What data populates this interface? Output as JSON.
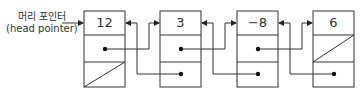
{
  "diagram": {
    "type": "doubly-linked-list",
    "head_label_ko": "머리 포인터",
    "head_label_en": "(head pointer)",
    "nodes": [
      {
        "value": "12",
        "prev": "null",
        "next": "node2"
      },
      {
        "value": "3",
        "prev": "node1",
        "next": "node3"
      },
      {
        "value": "−8",
        "prev": "node2",
        "next": "node4"
      },
      {
        "value": "6",
        "prev": "node3",
        "next": "null"
      }
    ]
  }
}
